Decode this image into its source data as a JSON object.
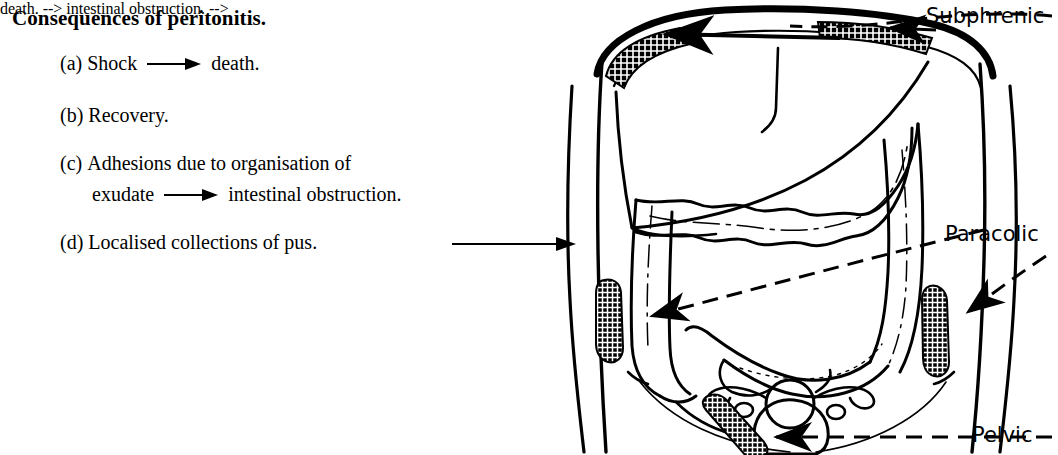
{
  "figure": {
    "heading": "Consequences of peritonitis.",
    "items": [
      {
        "marker": "(a)",
        "before": "Shock",
        "arrow": true,
        "after": "death."
      },
      {
        "marker": "(b)",
        "before": "Recovery.",
        "arrow": false,
        "after": ""
      },
      {
        "marker": "(c)",
        "before": "Adhesions due to organisation of",
        "arrow": false,
        "after": ""
      },
      {
        "marker": "",
        "before": "exudate",
        "arrow": true,
        "after": "intestinal obstruction."
      },
      {
        "marker": "(d)",
        "before": "Localised collections of pus.",
        "arrow": false,
        "after": ""
      }
    ],
    "pointer_arrow_name": "pus-to-diagram-arrow"
  },
  "annotations": {
    "subphrenic": "Subphrenic",
    "paracolic": "Paracolic",
    "pelvic": "Pelvic"
  },
  "diagram": {
    "parts": [
      "body-outline",
      "diaphragm",
      "liver",
      "transverse-colon",
      "ascending-colon",
      "descending-colon",
      "sigmoid-colon",
      "caecum",
      "uterus",
      "bladder",
      "ovaries",
      "pelvic-brim"
    ],
    "collections": [
      "subphrenic-collection-left",
      "subphrenic-collection-right",
      "paracolic-collection-left",
      "paracolic-collection-right",
      "pelvic-collection"
    ]
  },
  "colors": {
    "ink": "#000000",
    "paper": "#ffffff"
  }
}
